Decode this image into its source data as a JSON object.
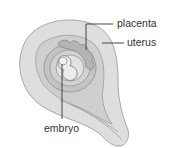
{
  "diagram": {
    "type": "anatomical-illustration",
    "colors": {
      "background": "#ffffff",
      "uterus_wall": "#dcdcdc",
      "uterus_outline": "#9a9a9a",
      "inner_cavity": "#c8c8c8",
      "placenta": "#b0b0b0",
      "leader_line": "#333333",
      "label_text": "#333333"
    },
    "labels": [
      {
        "id": "placenta",
        "text": "placenta"
      },
      {
        "id": "uterus",
        "text": "uterus"
      },
      {
        "id": "embryo",
        "text": "embryo"
      }
    ]
  }
}
